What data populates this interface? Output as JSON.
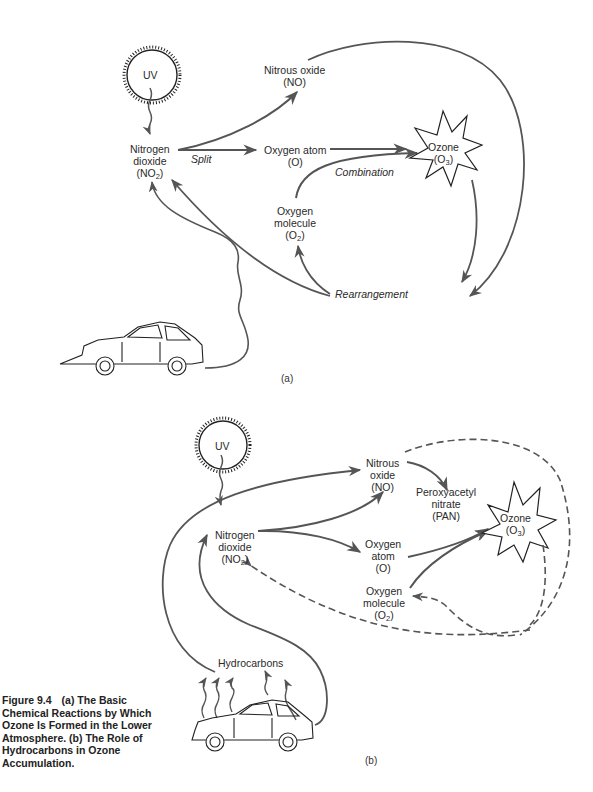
{
  "figure": {
    "number": "Figure 9.4",
    "caption": "(a) The Basic Chemical Reactions by Which Ozone Is Formed in the Lower Atmosphere. (b) The Role of Hydrocarbons in Ozone Accumulation."
  },
  "colors": {
    "arrow": "#555555",
    "ink": "#222222",
    "background": "#ffffff"
  },
  "panel_a": {
    "tag": "(a)",
    "nodes": {
      "uv": "UV",
      "no2": {
        "name": "Nitrogen",
        "name2": "dioxide",
        "formula_prefix": "(NO",
        "formula_sub": "2",
        "formula_suffix": ")"
      },
      "no": {
        "name": "Nitrous oxide",
        "formula": "(NO)"
      },
      "o": {
        "name": "Oxygen atom",
        "formula": "(O)"
      },
      "o3": {
        "name": "Ozone",
        "formula_prefix": "(O",
        "formula_sub": "3",
        "formula_suffix": ")"
      },
      "o2": {
        "name": "Oxygen",
        "name2": "molecule",
        "formula_prefix": "(O",
        "formula_sub": "2",
        "formula_suffix": ")"
      }
    },
    "process_labels": {
      "split": "Split",
      "combination": "Combination",
      "rearrangement": "Rearrangement"
    }
  },
  "panel_b": {
    "tag": "(b)",
    "nodes": {
      "uv": "UV",
      "no2": {
        "name": "Nitrogen",
        "name2": "dioxide",
        "formula_prefix": "(NO",
        "formula_sub": "2",
        "formula_suffix": ")"
      },
      "no": {
        "name": "Nitrous",
        "name2": "oxide",
        "formula": "(NO)"
      },
      "pan": {
        "name": "Peroxyacetyl",
        "name2": "nitrate",
        "formula": "(PAN)"
      },
      "o": {
        "name": "Oxygen",
        "name2": "atom",
        "formula": "(O)"
      },
      "o3": {
        "name": "Ozone",
        "formula_prefix": "(O",
        "formula_sub": "3",
        "formula_suffix": ")"
      },
      "o2": {
        "name": "Oxygen",
        "name2": "molecule",
        "formula_prefix": "(O",
        "formula_sub": "2",
        "formula_suffix": ")"
      },
      "hc": "Hydrocarbons"
    }
  }
}
